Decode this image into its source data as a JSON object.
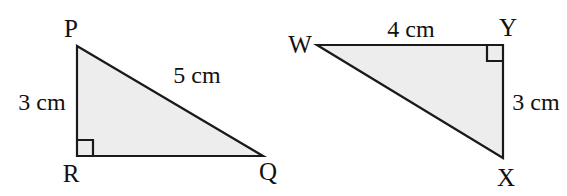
{
  "figure": {
    "background_color": "#ffffff",
    "shape_fill": "#ededed",
    "stroke_color": "#1a1a1a",
    "triangles": [
      {
        "id": "triangle-pqr",
        "vertices": [
          {
            "name": "P",
            "label": "P"
          },
          {
            "name": "Q",
            "label": "Q"
          },
          {
            "name": "R",
            "label": "R"
          }
        ],
        "right_angle_at": "R",
        "measures": [
          {
            "side": "PR",
            "label": "3 cm"
          },
          {
            "side": "PQ",
            "label": "5 cm"
          }
        ]
      },
      {
        "id": "triangle-wxy",
        "vertices": [
          {
            "name": "W",
            "label": "W"
          },
          {
            "name": "X",
            "label": "X"
          },
          {
            "name": "Y",
            "label": "Y"
          }
        ],
        "right_angle_at": "Y",
        "measures": [
          {
            "side": "WY",
            "label": "4 cm"
          },
          {
            "side": "XY",
            "label": "3 cm"
          }
        ]
      }
    ]
  },
  "labels": {
    "p": "P",
    "q": "Q",
    "r": "R",
    "w": "W",
    "x": "X",
    "y": "Y",
    "pr_measure": "3 cm",
    "pq_measure": "5 cm",
    "wy_measure": "4 cm",
    "xy_measure": "3 cm"
  }
}
